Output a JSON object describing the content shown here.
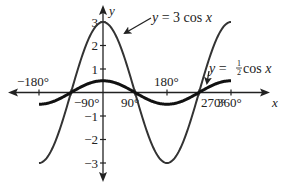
{
  "chart_data": {
    "type": "line",
    "title": "",
    "xlabel": "x",
    "ylabel": "y",
    "xlim": [
      -180,
      360
    ],
    "ylim": [
      -3,
      3
    ],
    "grid": false,
    "x_ticks": [
      -180,
      -90,
      90,
      180,
      270,
      360
    ],
    "x_tick_labels": [
      "−180°",
      "−90°",
      "90°",
      "180°",
      "270°",
      "360°"
    ],
    "y_ticks": [
      3,
      2,
      1,
      -1,
      -2,
      -3
    ],
    "y_tick_labels": [
      "3",
      "2",
      "1",
      "−1",
      "−2",
      "−3"
    ],
    "series": [
      {
        "name": "y = 3 cos x",
        "function": "3*cos(x)",
        "amplitude": 3,
        "x": [
          -180,
          -90,
          0,
          90,
          180,
          270,
          360
        ],
        "values": [
          -3,
          0,
          3,
          0,
          -3,
          0,
          3
        ],
        "color": "#333333",
        "stroke_width": 2
      },
      {
        "name": "y = ½ cos x",
        "function": "0.5*cos(x)",
        "amplitude": 0.5,
        "x": [
          -180,
          -90,
          0,
          90,
          180,
          270,
          360
        ],
        "values": [
          -0.5,
          0,
          0.5,
          0,
          -0.5,
          0,
          0.5
        ],
        "color": "#111111",
        "stroke_width": 3
      }
    ],
    "annotations": [
      {
        "text_prefix": "y = 3 cos ",
        "var": "x",
        "points_to": "y = 3 cos x curve near x=30°"
      },
      {
        "text_prefix": "y = ",
        "frac": "½",
        "text_suffix": "cos ",
        "var": "x",
        "points_to": "y = ½ cos x curve near x=290°"
      }
    ],
    "legend": null
  },
  "labels": {
    "y_axis": "y",
    "x_axis": "x",
    "eq1_left": "y",
    "eq1_mid": " = 3 cos ",
    "eq1_var": "x",
    "eq2_left": "y",
    "eq2_mid": " = ",
    "eq2_num": "1",
    "eq2_den": "2",
    "eq2_cos": "cos ",
    "eq2_var": "x"
  }
}
